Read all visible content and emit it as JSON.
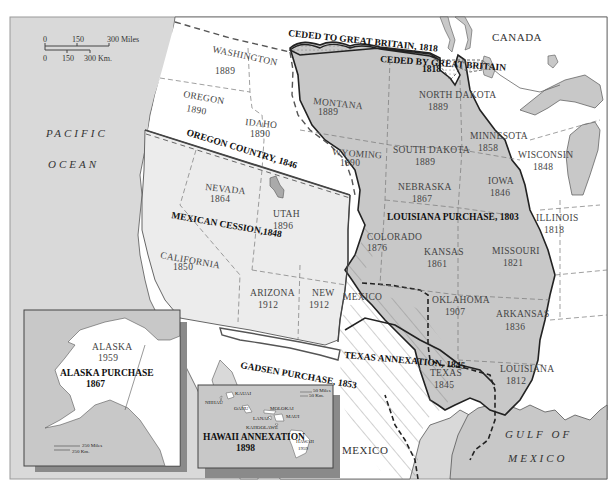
{
  "map": {
    "title": "U.S. Territorial Acquisitions",
    "colors": {
      "ocean": "#d9d9d9",
      "louisiana_purchase": "#c8c8c8",
      "mexican_cession": "#ececec",
      "oregon_country": "#ffffff",
      "land_other": "#ffffff",
      "lake": "#c8c8c8",
      "frame": "#999999",
      "inset_shadow": "#8a8a8a"
    },
    "scale_bar": {
      "miles_ticks": [
        "0",
        "150",
        "300 Miles"
      ],
      "km_ticks": [
        "0",
        "150",
        "300 Km."
      ]
    },
    "water_labels": {
      "pacific_1": "PACIFIC",
      "pacific_2": "OCEAN",
      "gulf_1": "GULF OF",
      "gulf_2": "MEXICO"
    },
    "countries": {
      "canada": "CANADA",
      "mexico": "MEXICO"
    },
    "acquisitions": [
      {
        "name": "CEDED TO GREAT BRITAIN, 1818"
      },
      {
        "name": "CEDED BY GREAT BRITAIN",
        "year": "1818"
      },
      {
        "name": "OREGON COUNTRY, 1846"
      },
      {
        "name": "MEXICAN CESSION,1848"
      },
      {
        "name": "LOUISIANA PURCHASE, 1803"
      },
      {
        "name": "TEXAS ANNEXATION, 1845"
      },
      {
        "name": "GADSEN PURCHASE, 1853"
      },
      {
        "name": "ALASKA PURCHASE",
        "year": "1867"
      },
      {
        "name": "HAWAII ANNEXATION",
        "year": "1898"
      }
    ],
    "states": [
      {
        "name": "WASHINGTON",
        "year": "1889"
      },
      {
        "name": "OREGON",
        "year": "1859"
      },
      {
        "name": "IDAHO",
        "year": "1890"
      },
      {
        "name": "MONTANA",
        "year": "1889"
      },
      {
        "name": "WYOMING",
        "year": "1890"
      },
      {
        "name": "NORTH DAKOTA",
        "year": "1889"
      },
      {
        "name": "SOUTH DAKOTA",
        "year": "1889"
      },
      {
        "name": "MINNESOTA",
        "year": "1858"
      },
      {
        "name": "WISCONSIN",
        "year": "1848"
      },
      {
        "name": "NEBRASKA",
        "year": "1867"
      },
      {
        "name": "IOWA",
        "year": "1846"
      },
      {
        "name": "ILLINOIS",
        "year": "1818"
      },
      {
        "name": "NEVADA",
        "year": "1864"
      },
      {
        "name": "UTAH",
        "year": "1896"
      },
      {
        "name": "COLORADO",
        "year": "1876"
      },
      {
        "name": "KANSAS",
        "year": "1861"
      },
      {
        "name": "MISSOURI",
        "year": "1821"
      },
      {
        "name": "CALIFORNIA",
        "year": "1850"
      },
      {
        "name": "ARIZONA",
        "year": "1912"
      },
      {
        "name": "NEW MEXICO",
        "year": "1912",
        "name_top": "NEW",
        "name_bottom": "MEXICO"
      },
      {
        "name": "OKLAHOMA",
        "year": "1907"
      },
      {
        "name": "ARKANSAS",
        "year": "1836"
      },
      {
        "name": "TEXAS",
        "year": "1845"
      },
      {
        "name": "LOUISIANA",
        "year": "1812"
      },
      {
        "name": "ALASKA",
        "year": "1959"
      },
      {
        "name": "HAWAII",
        "year": "1959"
      }
    ],
    "hawaii_islands": [
      "KAUAI",
      "NIIHAU",
      "OAHU",
      "MOLOKAI",
      "MAUI",
      "LANAI",
      "KAHOOLAWE",
      "HAWAII"
    ],
    "inset_scales": {
      "alaska": {
        "miles": "250 Miles",
        "km": "250 Km."
      },
      "hawaii": {
        "miles": "50 Miles",
        "km": "50 Km."
      }
    }
  }
}
